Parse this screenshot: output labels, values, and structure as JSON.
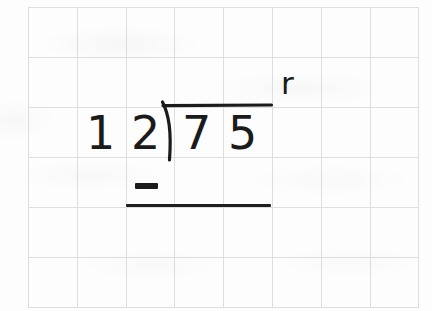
{
  "worksheet": {
    "title": "Long division practice",
    "paper": {
      "type": "grid-paper",
      "columns": 8,
      "rows": 6,
      "cell_width_px": 49,
      "cell_height_px": 50,
      "line_color": "#c9ccd2",
      "background_color": "#fdfdfd"
    },
    "ink_color": "#1b1b1b"
  },
  "problem": {
    "kind": "long-division",
    "divisor": "12",
    "divisor_digits": {
      "tens": "1",
      "ones": "2"
    },
    "dividend": "75",
    "dividend_digits": {
      "tens": "7",
      "ones": "5"
    },
    "quotient": "",
    "remainder": "",
    "remainder_label": "r",
    "operator": "−",
    "subtrahend": "",
    "expression": "12)75",
    "marks": {
      "division_bracket": "division-bracket",
      "minus_sign": "minus-sign",
      "subtraction_rule": "subtraction-rule"
    }
  }
}
